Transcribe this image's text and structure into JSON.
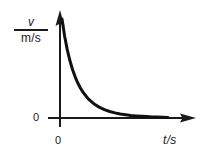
{
  "figure": {
    "kind": "line-graph",
    "background_color": "#ffffff",
    "ink_color": "#1a1a1a"
  },
  "axes": {
    "y": {
      "quantity_symbol": "v",
      "unit": "m/s",
      "zero_label": "0",
      "arrow": "up-arrow-icon"
    },
    "x": {
      "label": "t/s",
      "zero_label": "0",
      "arrow": "right-arrow-icon"
    }
  },
  "chart_data": {
    "type": "line",
    "title": "",
    "subtitle": "",
    "xlabel": "t/s",
    "ylabel": "v\nm/s",
    "grid": false,
    "legend": null,
    "xlim": [
      0,
      10
    ],
    "ylim": [
      0,
      10
    ],
    "axis_tick_labels": {
      "x": [
        "0"
      ],
      "y": [
        "0"
      ]
    },
    "annotations": [],
    "series": [
      {
        "name": "exponential decay of velocity",
        "style": "solid",
        "width_px": 3,
        "color": "#111111",
        "x": [
          0.0,
          0.25,
          0.5,
          0.75,
          1.0,
          1.25,
          1.5,
          1.75,
          2.0,
          2.5,
          3.0,
          3.5,
          4.0,
          4.5,
          5.0,
          5.5,
          6.0,
          6.5,
          7.0,
          7.5,
          8.0,
          8.5,
          9.0,
          9.5,
          10.0
        ],
        "y": [
          10.0,
          8.25,
          6.88,
          5.78,
          4.87,
          4.13,
          3.51,
          3.0,
          2.57,
          1.91,
          1.44,
          1.1,
          0.85,
          0.66,
          0.52,
          0.41,
          0.33,
          0.26,
          0.21,
          0.17,
          0.14,
          0.11,
          0.09,
          0.08,
          0.06
        ]
      }
    ]
  }
}
